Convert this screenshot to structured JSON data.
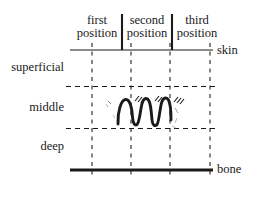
{
  "figure": {
    "type": "diagram",
    "background_color": "#ffffff",
    "ink_color": "#1a1a1a"
  },
  "column_headers": [
    {
      "line1": "first",
      "line2": "position"
    },
    {
      "line1": "second",
      "line2": "position"
    },
    {
      "line1": "third",
      "line2": "position"
    }
  ],
  "depth_labels": [
    {
      "text": "superficial"
    },
    {
      "text": "middle"
    },
    {
      "text": "deep"
    }
  ],
  "boundary_labels": [
    {
      "text": "skin"
    },
    {
      "text": "bone"
    }
  ],
  "annotation": {
    "squiggle_name": "wavy-needle-track",
    "hatch_count": 3
  },
  "geometry": {
    "grid_left": 70,
    "grid_right": 212,
    "skin_y": 50,
    "dashed_h_y": [
      86,
      128
    ],
    "bone_y": 170,
    "dashed_v_x": [
      92,
      131,
      170,
      210
    ],
    "solid_sep_x": [
      122,
      172
    ],
    "solid_sep_top": 14,
    "solid_sep_bottom": 50
  }
}
